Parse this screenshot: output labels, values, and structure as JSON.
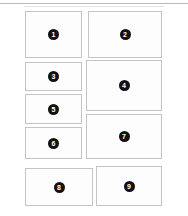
{
  "figure": {
    "type": "grid-layout-diagram",
    "background_color": "#ffffff",
    "panel_fill_color": "#fdfdfd",
    "panel_border_color": "#c4c4c4",
    "badge_color": "#111111",
    "badge_text_color": "#ffffff",
    "top_rule_color": "#b9b9b9",
    "panel_count": 9
  },
  "panels": [
    {
      "label": "1",
      "x": 25,
      "y": 11,
      "width": 57,
      "height": 47
    },
    {
      "label": "2",
      "x": 88,
      "y": 11,
      "width": 74,
      "height": 47
    },
    {
      "label": "3",
      "x": 25,
      "y": 62,
      "width": 57,
      "height": 29
    },
    {
      "label": "4",
      "x": 86,
      "y": 60,
      "width": 76,
      "height": 51
    },
    {
      "label": "5",
      "x": 25,
      "y": 94,
      "width": 57,
      "height": 30
    },
    {
      "label": "6",
      "x": 25,
      "y": 127,
      "width": 57,
      "height": 32
    },
    {
      "label": "7",
      "x": 86,
      "y": 114,
      "width": 76,
      "height": 45
    },
    {
      "label": "8",
      "x": 25,
      "y": 168,
      "width": 68,
      "height": 38
    },
    {
      "label": "9",
      "x": 96,
      "y": 166,
      "width": 66,
      "height": 40
    }
  ]
}
